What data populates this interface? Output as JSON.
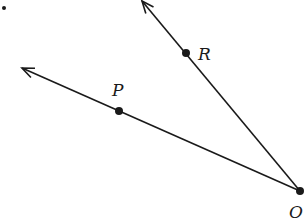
{
  "diagram": {
    "type": "rays-from-common-vertex",
    "vertex": {
      "name": "O",
      "label": "O",
      "x": 300,
      "y": 191,
      "label_x": 289,
      "label_y": 218
    },
    "points": [
      {
        "name": "P",
        "label": "P",
        "x": 119,
        "y": 111,
        "label_x": 112,
        "label_y": 96
      },
      {
        "name": "R",
        "label": "R",
        "x": 186,
        "y": 53,
        "label_x": 198,
        "label_y": 60
      }
    ],
    "rays": [
      {
        "name": "ray-OP",
        "from": "O",
        "through": "P",
        "tip": {
          "x": 22,
          "y": 68
        }
      },
      {
        "name": "ray-OR",
        "from": "O",
        "through": "R",
        "tip": {
          "x": 142,
          "y": 1
        }
      }
    ],
    "stray_dot": {
      "x": 4,
      "y": 8
    },
    "colors": {
      "stroke": "#1a1a1a",
      "background": "#ffffff"
    }
  }
}
